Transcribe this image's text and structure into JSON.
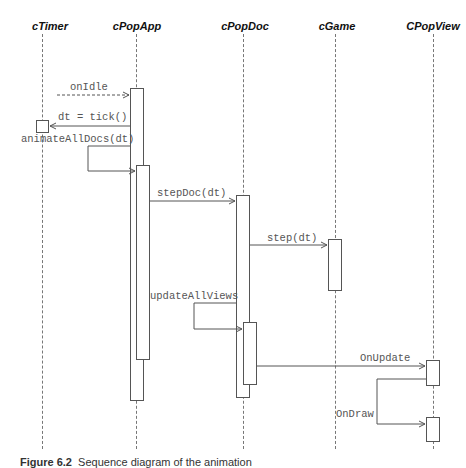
{
  "objects": [
    {
      "name": "cTimer"
    },
    {
      "name": "cPopApp"
    },
    {
      "name": "cPopDoc"
    },
    {
      "name": "cGame"
    },
    {
      "name": "CPopView"
    }
  ],
  "messages": [
    {
      "label": "onIdle",
      "from": "external",
      "to": "cPopApp",
      "style": "dashed"
    },
    {
      "label": "dt = tick()",
      "from": "cPopApp",
      "to": "cTimer",
      "style": "solid"
    },
    {
      "label": "animateAllDocs(dt)",
      "from": "cPopApp",
      "to": "cPopApp",
      "style": "self"
    },
    {
      "label": "stepDoc(dt)",
      "from": "cPopApp",
      "to": "cPopDoc",
      "style": "solid"
    },
    {
      "label": "step(dt)",
      "from": "cPopDoc",
      "to": "cGame",
      "style": "solid"
    },
    {
      "label": "updateAllViews",
      "from": "cPopDoc",
      "to": "cPopDoc",
      "style": "self"
    },
    {
      "label": "OnUpdate",
      "from": "cPopDoc",
      "to": "CPopView",
      "style": "solid"
    },
    {
      "label": "OnDraw",
      "from": "CPopView",
      "to": "CPopView",
      "style": "self"
    }
  ],
  "caption": {
    "figure": "Figure 6.2",
    "text": "Sequence diagram of the animation"
  }
}
